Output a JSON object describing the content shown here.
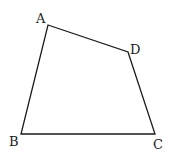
{
  "figure": {
    "type": "quadrilateral",
    "vertices": [
      {
        "name": "A",
        "x": 48,
        "y": 25,
        "label_x": 36,
        "label_y": 23
      },
      {
        "name": "D",
        "x": 128,
        "y": 52,
        "label_x": 130,
        "label_y": 54
      },
      {
        "name": "C",
        "x": 155,
        "y": 134,
        "label_x": 153,
        "label_y": 149
      },
      {
        "name": "B",
        "x": 21,
        "y": 134,
        "label_x": 9,
        "label_y": 146
      }
    ],
    "edges": [
      [
        "A",
        "D"
      ],
      [
        "D",
        "C"
      ],
      [
        "C",
        "B"
      ],
      [
        "B",
        "A"
      ]
    ],
    "labels": {
      "A": "A",
      "B": "B",
      "C": "C",
      "D": "D"
    }
  }
}
